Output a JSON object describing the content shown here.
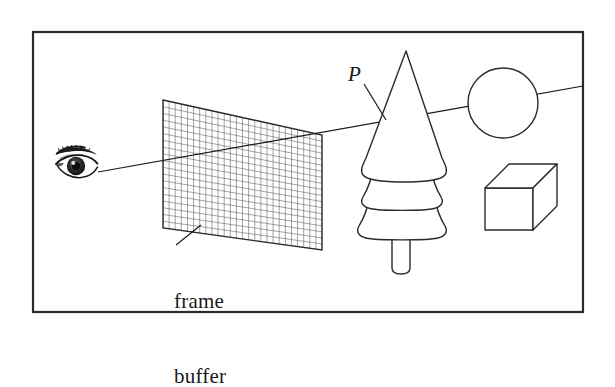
{
  "figure": {
    "background_color": "#ffffff",
    "stroke_color": "#1a1a1a",
    "grid_color": "#555555",
    "border": {
      "x": 33,
      "y": 32,
      "width": 550,
      "height": 280,
      "stroke_width": 2.2
    }
  },
  "labels": {
    "frame_buffer": {
      "line1": "frame",
      "line2": "buffer"
    },
    "point_p": "P"
  },
  "leader_lines": {
    "frame_buffer": {
      "x1": 176,
      "y1": 245,
      "x2": 201,
      "y2": 225
    },
    "point_p": {
      "x1": 364,
      "y1": 84,
      "x2": 385,
      "y2": 119
    }
  },
  "eye": {
    "center_x": 76,
    "center_y": 167,
    "description": "human eye viewpoint"
  },
  "frame_buffer_plane": {
    "corners": [
      {
        "x": 163,
        "y": 100
      },
      {
        "x": 322,
        "y": 135
      },
      {
        "x": 322,
        "y": 250
      },
      {
        "x": 163,
        "y": 228
      }
    ],
    "columns": 26,
    "rows": 19
  },
  "ray": {
    "start_x": 98,
    "start_y": 172,
    "end_x": 583,
    "end_y": 86,
    "hit_grid_x": 310,
    "hit_grid_y": 134
  },
  "tree": {
    "apex_x": 406,
    "apex_y": 51,
    "trunk_top_y": 238,
    "tiers": 3
  },
  "sphere": {
    "cx": 503,
    "cy": 103,
    "r": 35
  },
  "box": {
    "front": {
      "x": 485,
      "y": 188,
      "width": 48,
      "height": 42
    },
    "depth_dx": 24,
    "depth_dy": -24
  },
  "colors": {
    "ink": "#1a1a1a",
    "grid": "#555555",
    "paper": "#ffffff"
  }
}
